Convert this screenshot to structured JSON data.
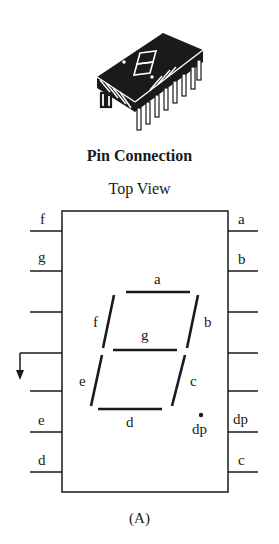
{
  "figure": {
    "title": "Pin Connection",
    "subtitle": "Top View",
    "caption": "(A)"
  },
  "left_pins": [
    {
      "label": "f"
    },
    {
      "label": "g"
    },
    {
      "label": ""
    },
    {
      "label": "",
      "ground": true
    },
    {
      "label": ""
    },
    {
      "label": "e"
    },
    {
      "label": "d"
    }
  ],
  "right_pins": [
    {
      "label": "a"
    },
    {
      "label": "b"
    },
    {
      "label": ""
    },
    {
      "label": ""
    },
    {
      "label": ""
    },
    {
      "label": "dp"
    },
    {
      "label": "c"
    }
  ],
  "segments": {
    "a": "a",
    "b": "b",
    "c": "c",
    "d": "d",
    "e": "e",
    "f": "f",
    "g": "g",
    "dp": "dp"
  },
  "colors": {
    "ink": "#1a1a1a",
    "background": "#ffffff"
  }
}
